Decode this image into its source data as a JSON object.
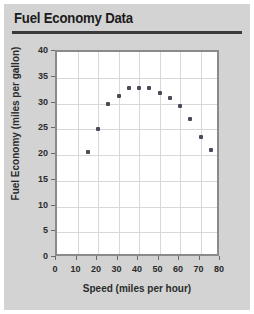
{
  "card": {
    "title": "Fuel Economy Data",
    "background_color": "#d3d3d3",
    "rule_color": "#3a3a3a"
  },
  "chart_data": {
    "type": "scatter",
    "title": "Fuel Economy Data",
    "xlabel": "Speed (miles per hour)",
    "ylabel": "Fuel Economy (miles per gallon)",
    "xlim": [
      0,
      80
    ],
    "ylim": [
      0,
      40
    ],
    "xticks": [
      0,
      10,
      20,
      30,
      40,
      50,
      60,
      70,
      80
    ],
    "yticks": [
      0,
      5,
      10,
      15,
      20,
      25,
      30,
      35,
      40
    ],
    "grid": true,
    "legend": "none",
    "marker_color": "#4a4a58",
    "x": [
      15,
      20,
      25,
      30,
      35,
      40,
      45,
      50,
      55,
      60,
      65,
      70,
      75
    ],
    "y": [
      20.5,
      25,
      30,
      31.5,
      33,
      33,
      33,
      32,
      31,
      29.5,
      27,
      23.5,
      21
    ]
  }
}
